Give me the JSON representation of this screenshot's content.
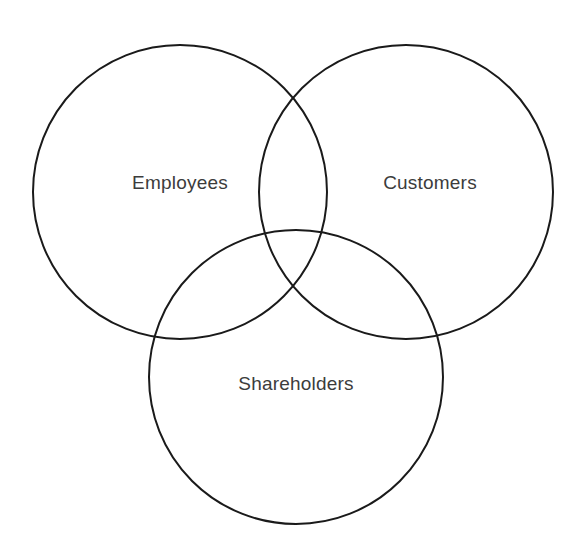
{
  "page": {
    "background_color": "#ffffff",
    "width": 588,
    "height": 556
  },
  "style": {
    "stroke_color": "#1a1a1a",
    "stroke_width": 2,
    "label_color": "#3c3c3c",
    "label_font_size": 19,
    "fill": "none"
  },
  "chart_data": {
    "type": "diagram",
    "subtype": "venn",
    "title": "",
    "set_count": 3,
    "sets": [
      {
        "id": "employees",
        "label": "Employees",
        "cx": 180,
        "cy": 192,
        "r": 147,
        "label_x": 180,
        "label_y": 184,
        "stroke": "#1a1a1a",
        "fill": "none"
      },
      {
        "id": "customers",
        "label": "Customers",
        "cx": 406,
        "cy": 192,
        "r": 147,
        "label_x": 430,
        "label_y": 184,
        "stroke": "#1a1a1a",
        "fill": "none"
      },
      {
        "id": "shareholders",
        "label": "Shareholders",
        "cx": 296,
        "cy": 377,
        "r": 147,
        "label_x": 296,
        "label_y": 385,
        "stroke": "#1a1a1a",
        "fill": "none"
      }
    ],
    "intersections": [
      {
        "sets": [
          "employees",
          "customers"
        ],
        "label": ""
      },
      {
        "sets": [
          "employees",
          "shareholders"
        ],
        "label": ""
      },
      {
        "sets": [
          "customers",
          "shareholders"
        ],
        "label": ""
      },
      {
        "sets": [
          "employees",
          "customers",
          "shareholders"
        ],
        "label": ""
      }
    ],
    "legend": null,
    "annotations": []
  }
}
